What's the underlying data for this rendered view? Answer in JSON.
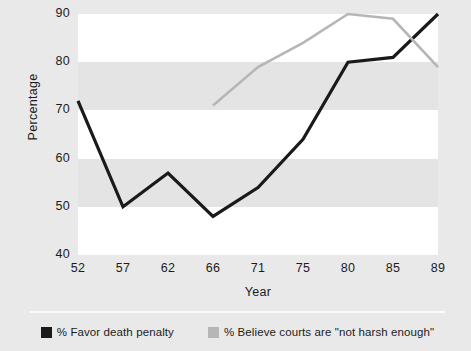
{
  "chart_data": {
    "type": "line",
    "title": "",
    "xlabel": "Year",
    "ylabel": "Percentage",
    "categories": [
      "52",
      "57",
      "62",
      "66",
      "71",
      "75",
      "80",
      "85",
      "89"
    ],
    "xlim": [
      0,
      8
    ],
    "ylim": [
      40,
      90
    ],
    "yticks": [
      90,
      80,
      70,
      60,
      50,
      40
    ],
    "grid": false,
    "banded_background": true,
    "legend_position": "bottom",
    "series": [
      {
        "name": "% Favor death penalty",
        "color": "#1a1a1a",
        "values": [
          72,
          50,
          57,
          48,
          54,
          64,
          80,
          81,
          90
        ]
      },
      {
        "name": "% Believe courts are \"not harsh enough\"",
        "color": "#b6b6b6",
        "values": [
          null,
          null,
          null,
          71,
          79,
          84,
          90,
          89,
          79
        ]
      }
    ]
  },
  "axes": {
    "y_tick_labels": [
      "90",
      "80",
      "70",
      "60",
      "50",
      "40"
    ],
    "x_tick_labels": [
      "52",
      "57",
      "62",
      "66",
      "71",
      "75",
      "80",
      "85",
      "89"
    ],
    "y_axis_title": "Percentage",
    "x_axis_title": "Year"
  },
  "legend": {
    "items": [
      {
        "label": "% Favor death penalty",
        "color": "#1a1a1a"
      },
      {
        "label": "% Believe courts are \"not harsh enough\"",
        "color": "#b6b6b6"
      }
    ]
  },
  "colors": {
    "background": "#e9e9e9",
    "band_white": "#ffffff",
    "band_gray": "#e4e4e4",
    "series_dark": "#1a1a1a",
    "series_light": "#b6b6b6",
    "text": "#1c1c1c"
  }
}
